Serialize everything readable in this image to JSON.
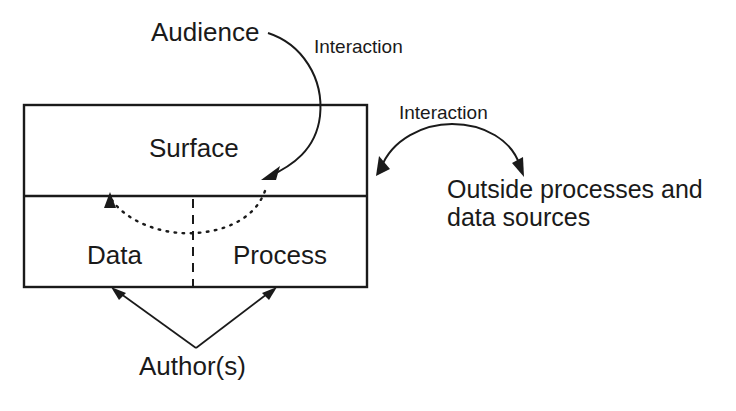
{
  "diagram": {
    "colors": {
      "ink": "#1a1a1a",
      "background": "#ffffff"
    },
    "labels": {
      "audience": "Audience",
      "interaction_top": "Interaction",
      "interaction_right": "Interaction",
      "surface": "Surface",
      "data": "Data",
      "process": "Process",
      "outside_line1": "Outside processes and",
      "outside_line2": "data sources",
      "authors": "Author(s)"
    },
    "nodes": [
      {
        "id": "surface",
        "label": "Surface",
        "region": "upper-box"
      },
      {
        "id": "data",
        "label": "Data",
        "region": "lower-box-left"
      },
      {
        "id": "process",
        "label": "Process",
        "region": "lower-box-right"
      },
      {
        "id": "audience",
        "label": "Audience",
        "region": "outside-top-left"
      },
      {
        "id": "outside",
        "label": "Outside processes and data sources",
        "region": "outside-right"
      },
      {
        "id": "authors",
        "label": "Author(s)",
        "region": "outside-bottom"
      }
    ],
    "edges": [
      {
        "from": "audience",
        "to": "surface",
        "label": "Interaction",
        "style": "curved-arrow"
      },
      {
        "from": "surface",
        "to": "outside",
        "label": "Interaction",
        "style": "curved-double-arrow"
      },
      {
        "from": "process",
        "to": "data",
        "label": "",
        "style": "dotted-arc-arrow"
      },
      {
        "from": "authors",
        "to": "data",
        "label": "",
        "style": "straight-arrow"
      },
      {
        "from": "authors",
        "to": "process",
        "label": "",
        "style": "straight-arrow"
      }
    ]
  }
}
